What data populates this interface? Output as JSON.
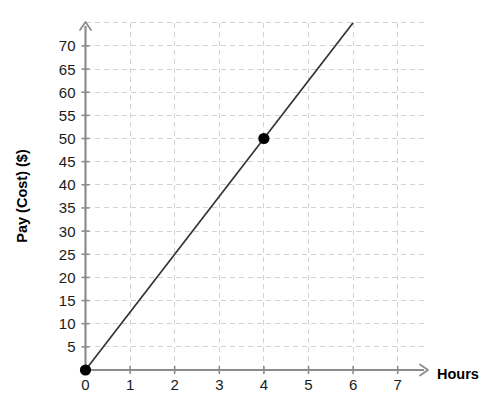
{
  "chart_data": {
    "type": "line",
    "title": "",
    "subtitle": "",
    "xlabel": "Hours",
    "ylabel": "Pay (Cost) ($)",
    "xlim": [
      0,
      7.6
    ],
    "ylim": [
      0,
      75
    ],
    "xticks": [
      0,
      1,
      2,
      3,
      4,
      5,
      6,
      7
    ],
    "xtick_labels": [
      "0",
      "1",
      "2",
      "3",
      "4",
      "5",
      "6",
      "7"
    ],
    "yticks": [
      5,
      10,
      15,
      20,
      25,
      30,
      35,
      40,
      45,
      50,
      55,
      60,
      65,
      70
    ],
    "ytick_labels": [
      "5",
      "10",
      "15",
      "20",
      "25",
      "30",
      "35",
      "40",
      "45",
      "50",
      "55",
      "60",
      "65",
      "70"
    ],
    "grid": true,
    "grid_style": "dashed",
    "grid_color": "#d2d2d2",
    "legend": false,
    "legend_position": "none",
    "axis_color": "#8c8c8c",
    "line_color": "#333333",
    "marker_color": "#000000",
    "series": [
      {
        "name": "Pay vs Hours",
        "type": "line",
        "slope": 12.5,
        "intercept": 0,
        "x": [
          0,
          6
        ],
        "values": [
          0,
          75
        ],
        "markers": [
          {
            "x": 0,
            "y": 0,
            "label": "(0, 0)"
          },
          {
            "x": 4,
            "y": 50,
            "label": "(4, 50)"
          }
        ]
      }
    ]
  },
  "axes": {
    "x_title": "Hours",
    "y_title": "Pay (Cost) ($)"
  }
}
